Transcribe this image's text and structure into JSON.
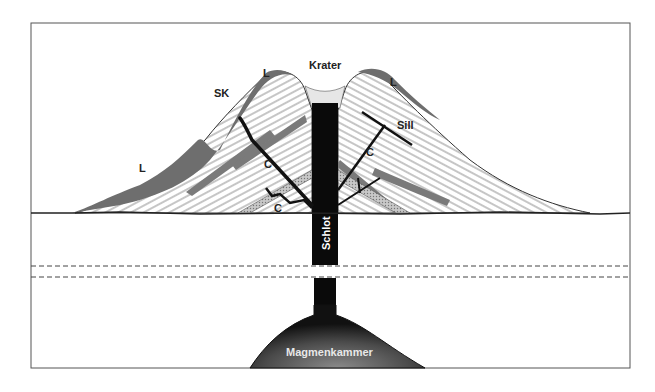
{
  "diagram": {
    "type": "volcano cross-section (stratovolcano)",
    "labels": {
      "crater": "Krater",
      "lava_left_high": "L",
      "lava_right": "L",
      "lava_left_low": "L",
      "parasitic_cone": "SK",
      "sill": "Sill",
      "dike_left_upper": "C",
      "dike_left_lower": "C",
      "dike_right": "C",
      "conduit": "Schlot",
      "magma_chamber": "Magmenkammer"
    },
    "colors": {
      "background": "#ffffff",
      "frame": "#555555",
      "strata_lines": "#9a9a9a",
      "lava_flow": "#6e6e6e",
      "conduit": "#0a0a0a",
      "chamber_dark": "#1a1a1a",
      "chamber_light": "#777777",
      "crater_fill": "#e6e6e6",
      "pyroclastic_layer": "#a8a8a8"
    }
  }
}
